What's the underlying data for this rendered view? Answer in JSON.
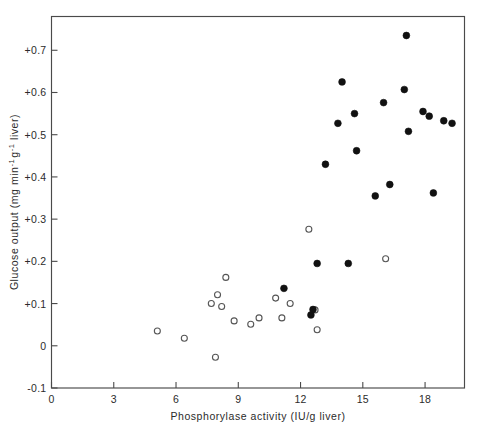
{
  "chart_data": {
    "type": "scatter",
    "title": "",
    "xlabel": "Phosphorylase activity (IU/g liver)",
    "ylabel": "Glucose output (mg min⁻¹ g⁻¹ liver)",
    "ylabel_parts": {
      "lead": "Glucose output (mg min",
      "sup1": "-1",
      "mid": "g",
      "sup2": "-1",
      "tail": " liver)"
    },
    "xlim": [
      0,
      19.9
    ],
    "ylim": [
      -0.1,
      0.78
    ],
    "xticks": [
      0,
      3,
      6,
      9,
      12,
      15,
      18
    ],
    "xtick_labels": [
      "0",
      "3",
      "6",
      "9",
      "12",
      "15",
      "18"
    ],
    "yticks": [
      -0.1,
      0,
      0.1,
      0.2,
      0.3,
      0.4,
      0.5,
      0.6,
      0.7
    ],
    "ytick_labels": [
      "-0.1",
      "0",
      "+0.1",
      "+0.2",
      "+0.3",
      "+0.4",
      "+0.5",
      "+0.6",
      "+0.7"
    ],
    "grid": false,
    "legend": "none",
    "marker_colors": {
      "filled": "#111111",
      "open_edge": "#555555",
      "open_fill": "#ffffff"
    },
    "series": [
      {
        "name": "open-circles",
        "marker": "open-circle",
        "points": [
          [
            5.1,
            0.035
          ],
          [
            6.4,
            0.018
          ],
          [
            8.0,
            0.121
          ],
          [
            7.7,
            0.1
          ],
          [
            8.2,
            0.093
          ],
          [
            7.9,
            -0.027
          ],
          [
            8.4,
            0.162
          ],
          [
            8.8,
            0.059
          ],
          [
            9.6,
            0.051
          ],
          [
            10.0,
            0.066
          ],
          [
            11.1,
            0.066
          ],
          [
            10.8,
            0.113
          ],
          [
            11.5,
            0.1
          ],
          [
            12.4,
            0.276
          ],
          [
            12.7,
            0.085
          ],
          [
            12.8,
            0.038
          ],
          [
            16.1,
            0.206
          ]
        ]
      },
      {
        "name": "filled-circles",
        "marker": "filled-circle",
        "points": [
          [
            11.2,
            0.136
          ],
          [
            12.6,
            0.086
          ],
          [
            12.5,
            0.073
          ],
          [
            12.8,
            0.195
          ],
          [
            13.2,
            0.43
          ],
          [
            13.8,
            0.527
          ],
          [
            14.0,
            0.625
          ],
          [
            14.3,
            0.195
          ],
          [
            14.6,
            0.55
          ],
          [
            14.7,
            0.462
          ],
          [
            15.6,
            0.355
          ],
          [
            16.0,
            0.576
          ],
          [
            16.3,
            0.382
          ],
          [
            17.1,
            0.735
          ],
          [
            17.0,
            0.607
          ],
          [
            17.2,
            0.508
          ],
          [
            17.9,
            0.555
          ],
          [
            18.2,
            0.544
          ],
          [
            18.4,
            0.362
          ],
          [
            18.9,
            0.533
          ],
          [
            19.3,
            0.527
          ]
        ]
      }
    ]
  }
}
